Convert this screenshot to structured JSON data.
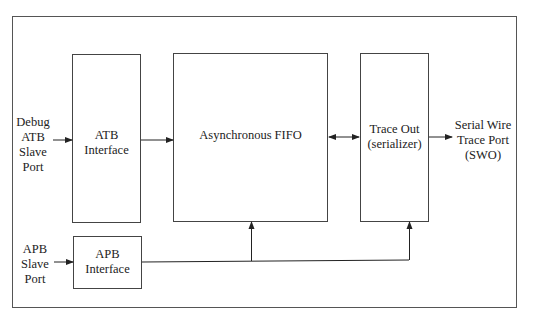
{
  "diagram": {
    "inputs": {
      "atb_port": [
        "Debug",
        "ATB",
        "Slave",
        "Port"
      ],
      "apb_port": [
        "APB",
        "Slave",
        "Port"
      ]
    },
    "blocks": {
      "atb_interface": [
        "ATB",
        "Interface"
      ],
      "async_fifo": "Asynchronous FIFO",
      "trace_out": [
        "Trace Out",
        "(serializer)"
      ],
      "apb_interface": [
        "APB",
        "Interface"
      ]
    },
    "outputs": {
      "swo": [
        "Serial Wire",
        "Trace Port",
        "(SWO)"
      ]
    },
    "colors": {
      "line": "#333333",
      "background": "#ffffff"
    }
  }
}
